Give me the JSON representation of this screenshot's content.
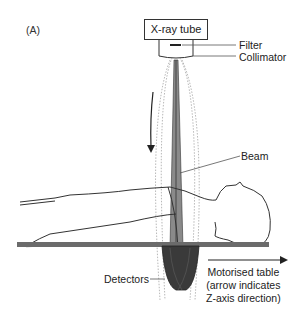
{
  "figure": {
    "panel_label": "(A)",
    "tube_label": "X-ray tube",
    "labels": {
      "filter": "Filter",
      "collimator": "Collimator",
      "beam": "Beam",
      "detectors": "Detectors"
    },
    "table_caption": {
      "line1": "Motorised table",
      "line2": "(arrow indicates",
      "line3": "Z-axis direction)"
    },
    "colors": {
      "line": "#222222",
      "table": "#6b6b6b",
      "detector": "#3a3a3a",
      "beam": "#8a8a8a",
      "orbit": "#9a9a9a"
    }
  }
}
